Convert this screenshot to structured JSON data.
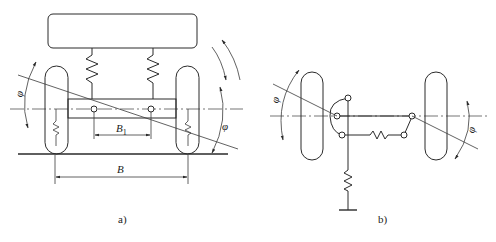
{
  "figure": {
    "subfigures": [
      {
        "id": "a",
        "caption": "a)",
        "labels": {
          "track_width": "B",
          "spring_base": "B",
          "spring_base_subscript": "1",
          "angle_left": "φ",
          "angle_right": "φ"
        }
      },
      {
        "id": "b",
        "caption": "b)",
        "labels": {
          "angle_left": "φ",
          "angle_right": "φ"
        }
      }
    ]
  }
}
